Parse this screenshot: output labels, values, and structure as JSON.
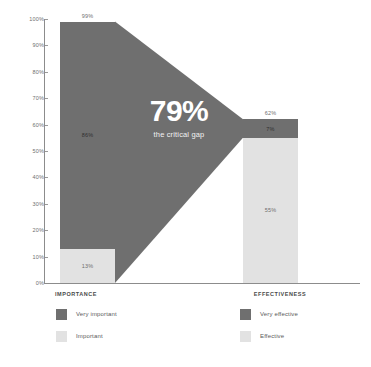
{
  "chart_data": {
    "type": "bar",
    "title": "",
    "subtitle": "",
    "xlabel": "",
    "ylabel": "",
    "ylim": [
      0,
      100
    ],
    "grid": false,
    "stacked": true,
    "legend_position": "bottom",
    "categories": [
      "IMPORTANCE",
      "EFFECTIVENESS"
    ],
    "series": [
      {
        "name": "Very important",
        "values": [
          86,
          null
        ],
        "color": "#6f6f6f"
      },
      {
        "name": "Important",
        "values": [
          13,
          null
        ],
        "color": "#e2e2e2"
      },
      {
        "name": "Very effective",
        "values": [
          null,
          7
        ],
        "color": "#6f6f6f"
      },
      {
        "name": "Effective",
        "values": [
          null,
          55
        ],
        "color": "#e2e2e2"
      }
    ],
    "bar_totals": [
      99,
      62
    ],
    "annotations": [
      {
        "text": "79%",
        "subtext": "the critical gap"
      }
    ],
    "tick_labels": [
      "100%",
      "90%",
      "80%",
      "70%",
      "60%",
      "50%",
      "40%",
      "30%",
      "20%",
      "10%",
      "0%"
    ],
    "tick_values": [
      100,
      90,
      80,
      70,
      60,
      50,
      40,
      30,
      20,
      10,
      0
    ]
  },
  "axis": {
    "ticks": [
      {
        "label": "100%",
        "value": 100
      },
      {
        "label": "90%",
        "value": 90
      },
      {
        "label": "80%",
        "value": 80
      },
      {
        "label": "70%",
        "value": 70
      },
      {
        "label": "60%",
        "value": 60
      },
      {
        "label": "50%",
        "value": 50
      },
      {
        "label": "40%",
        "value": 40
      },
      {
        "label": "30%",
        "value": 30
      },
      {
        "label": "20%",
        "value": 20
      },
      {
        "label": "10%",
        "value": 10
      },
      {
        "label": "0%",
        "value": 0
      }
    ]
  },
  "bars": {
    "importance": {
      "category": "IMPORTANCE",
      "total_label": "99%",
      "total": 99,
      "segments": [
        {
          "label": "86%",
          "value": 86,
          "tone": "dark"
        },
        {
          "label": "13%",
          "value": 13,
          "tone": "light"
        }
      ]
    },
    "effectiveness": {
      "category": "EFFECTIVENESS",
      "total_label": "62%",
      "total": 62,
      "segments": [
        {
          "label": "7%",
          "value": 7,
          "tone": "dark"
        },
        {
          "label": "55%",
          "value": 55,
          "tone": "light"
        }
      ]
    }
  },
  "callout": {
    "value": "79%",
    "subtext": "the critical gap"
  },
  "legend": {
    "left": [
      {
        "label": "Very important",
        "tone": "dark"
      },
      {
        "label": "Important",
        "tone": "light"
      }
    ],
    "right": [
      {
        "label": "Very effective",
        "tone": "dark"
      },
      {
        "label": "Effective",
        "tone": "light"
      }
    ]
  },
  "colors": {
    "dark": "#6f6f6f",
    "light": "#e2e2e2",
    "funnel": "#6f6f6f",
    "axis": "#8c8c8c",
    "tick_text": "#6f6f6f",
    "category_text": "#4a4a4a",
    "callout_text": "#ffffff",
    "background": "#ffffff"
  }
}
